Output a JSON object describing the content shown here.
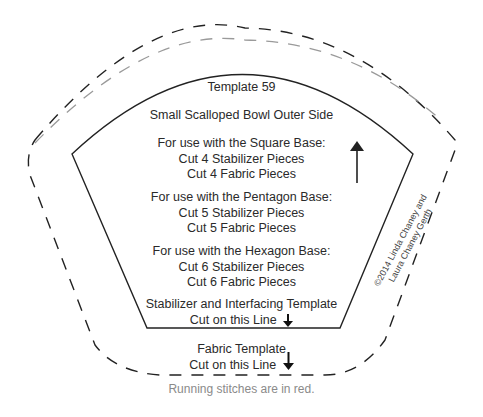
{
  "template": {
    "title": "Template 59",
    "subtitle": "Small Scalloped Bowl Outer Side",
    "groups": [
      {
        "heading": "For use with the Square Base:",
        "line1": "Cut 4 Stabilizer Pieces",
        "line2": "Cut 4 Fabric Pieces"
      },
      {
        "heading": "For use with the Pentagon Base:",
        "line1": "Cut 5 Stabilizer Pieces",
        "line2": "Cut 5 Fabric Pieces"
      },
      {
        "heading": "For use with the Hexagon Base:",
        "line1": "Cut 6 Stabilizer Pieces",
        "line2": "Cut 6 Fabric Pieces"
      }
    ],
    "stabilizer_label": "Stabilizer and Interfacing Template",
    "stabilizer_cut": "Cut on this Line",
    "fabric_label": "Fabric Template",
    "fabric_cut": "Cut on this Line",
    "copyright_line1": "©2014 Linda Chaney and",
    "copyright_line2": "Laura Chaney Gerth",
    "note": "Running stitches are in red.",
    "icons": {
      "grain": "arrow-up-icon",
      "cut": "arrow-down-icon"
    }
  },
  "colors": {
    "solid_line": "#222222",
    "fabric_dash": "#222222",
    "stitch_dash": "#9a9a9a",
    "note_text": "#8a8a8a"
  }
}
